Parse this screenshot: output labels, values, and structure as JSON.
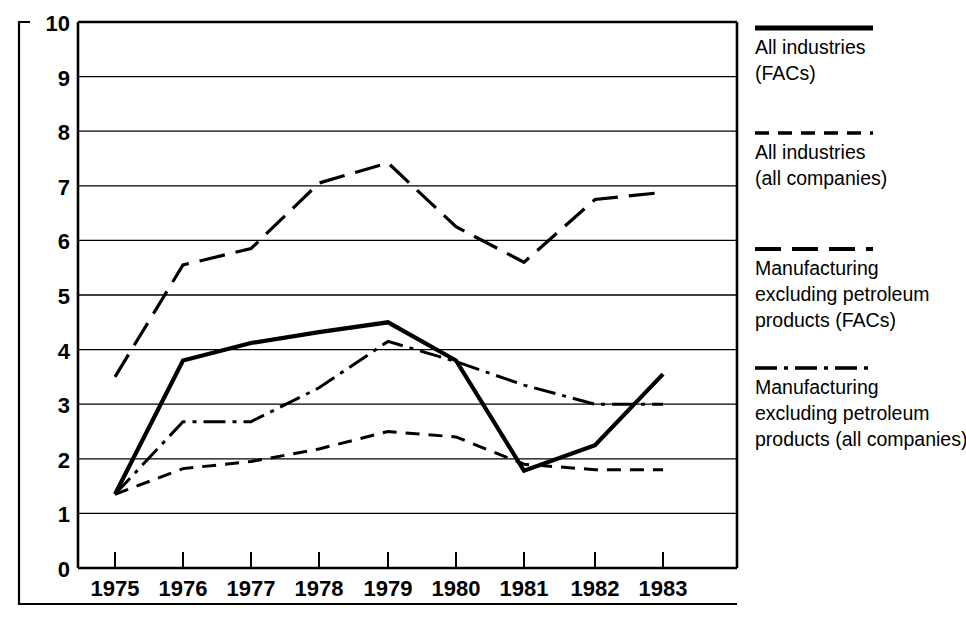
{
  "chart_data": {
    "type": "line",
    "title": "",
    "subtitle": "",
    "xlabel": "",
    "ylabel": "",
    "x": [
      "1975",
      "1976",
      "1977",
      "1978",
      "1979",
      "1980",
      "1981",
      "1982",
      "1983"
    ],
    "categories": [
      "1975",
      "1976",
      "1977",
      "1978",
      "1979",
      "1980",
      "1981",
      "1982",
      "1983"
    ],
    "xlim": [
      "1975",
      "1983"
    ],
    "ylim": [
      0,
      10
    ],
    "ytick_labels": [
      "0",
      "1",
      "2",
      "3",
      "4",
      "5",
      "6",
      "7",
      "8",
      "9",
      "10"
    ],
    "ytick_values": [
      0,
      1,
      2,
      3,
      4,
      5,
      6,
      7,
      8,
      9,
      10
    ],
    "grid": "horizontal",
    "legend_position": "right",
    "series": [
      {
        "name": "All industries (FACs)",
        "legend_label_line1": "All industries",
        "legend_label_line2": "(FACs)",
        "style": "solid",
        "color": "#000000",
        "width": 4.2,
        "values": [
          1.35,
          3.8,
          4.12,
          4.32,
          4.5,
          3.8,
          1.78,
          2.25,
          3.55
        ]
      },
      {
        "name": "All industries (all companies)",
        "legend_label_line1": "All industries",
        "legend_label_line2": "(all companies)",
        "style": "dashed",
        "color": "#000000",
        "width": 3.0,
        "values": [
          1.35,
          1.82,
          1.95,
          2.18,
          2.5,
          2.4,
          1.9,
          1.8,
          1.8
        ]
      },
      {
        "name": "Manufacturing excluding petroleum products (FACs)",
        "legend_label_line1": "Manufacturing",
        "legend_label_line2": "excluding petroleum",
        "legend_label_line3": "products (FACs)",
        "style": "long-dashed",
        "color": "#000000",
        "width": 3.2,
        "values": [
          3.5,
          5.55,
          5.85,
          7.05,
          7.42,
          6.25,
          5.6,
          6.75,
          6.88
        ]
      },
      {
        "name": "Manufacturing excluding petroleum products (all companies)",
        "legend_label_line1": "Manufacturing",
        "legend_label_line2": "excluding petroleum",
        "legend_label_line3": "products (all companies)",
        "style": "dash-dot",
        "color": "#000000",
        "width": 3.0,
        "values": [
          1.35,
          2.68,
          2.68,
          3.3,
          4.15,
          3.78,
          3.35,
          3.0,
          3.0
        ]
      }
    ]
  },
  "legend": {
    "items": [
      {
        "swatch": "solid-line-swatch",
        "lines": [
          "All industries",
          "(FACs)"
        ]
      },
      {
        "swatch": "dashed-line-swatch",
        "lines": [
          "All industries",
          "(all companies)"
        ]
      },
      {
        "swatch": "long-dashed-line-swatch",
        "lines": [
          "Manufacturing",
          "excluding petroleum",
          "products (FACs)"
        ]
      },
      {
        "swatch": "dash-dot-line-swatch",
        "lines": [
          "Manufacturing",
          "excluding petroleum",
          "products (all companies)"
        ]
      }
    ]
  },
  "axis": {
    "y_ticks": [
      "10",
      "9",
      "8",
      "7",
      "6",
      "5",
      "4",
      "3",
      "2",
      "1",
      "0"
    ],
    "x_ticks": [
      "1975",
      "1976",
      "1977",
      "1978",
      "1979",
      "1980",
      "1981",
      "1982",
      "1983"
    ]
  }
}
